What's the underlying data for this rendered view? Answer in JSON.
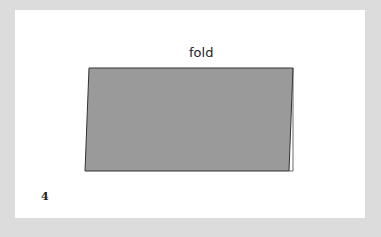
{
  "diagram": {
    "label": "fold",
    "page_number": "4",
    "colors": {
      "fill": "#9a9a9a",
      "stroke": "#333333",
      "background": "#dcdcdc",
      "page": "#ffffff"
    }
  }
}
